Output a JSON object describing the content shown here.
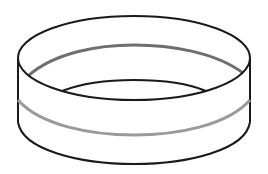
{
  "figure": {
    "colors": {
      "background": "#ffffff",
      "outline": "#1a1a1a",
      "inner_stripe": "#6e6e6e",
      "outer_stripe": "#9a9a9a"
    },
    "geometry": {
      "center_x": 134,
      "top_y": 58,
      "rx": 116,
      "ry": 42,
      "bottom_y": 122
    }
  }
}
